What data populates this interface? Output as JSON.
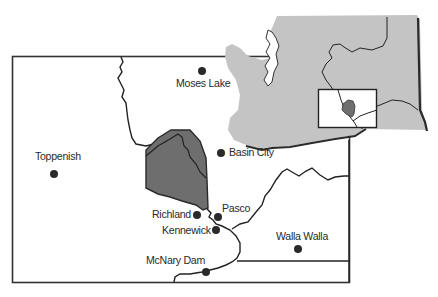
{
  "map": {
    "region": "South-central Washington",
    "colors": {
      "background": "#ffffff",
      "frame": "#333333",
      "state_fill": "#c4c4c4",
      "shaded_area": "#6e6e6e",
      "city_dot": "#2a2a2a",
      "river": "#222222"
    },
    "inset": {
      "name": "Washington State locator",
      "highlight_box": "study area"
    },
    "cities": [
      {
        "name": "Moses Lake",
        "x": 202,
        "y": 71
      },
      {
        "name": "Basin City",
        "x": 221,
        "y": 153
      },
      {
        "name": "Toppenish",
        "x": 54,
        "y": 174
      },
      {
        "name": "Richland",
        "x": 197,
        "y": 215
      },
      {
        "name": "Pasco",
        "x": 218,
        "y": 216
      },
      {
        "name": "Kennewick",
        "x": 216,
        "y": 230
      },
      {
        "name": "Walla Walla",
        "x": 298,
        "y": 249
      },
      {
        "name": "McNary Dam",
        "x": 206,
        "y": 272
      }
    ],
    "labels": {
      "moses_lake": "Moses Lake",
      "basin_city": "Basin City",
      "toppenish": "Toppenish",
      "richland": "Richland",
      "pasco": "Pasco",
      "kennewick": "Kennewick",
      "walla_walla": "Walla Walla",
      "mcnary_dam": "McNary Dam"
    }
  }
}
